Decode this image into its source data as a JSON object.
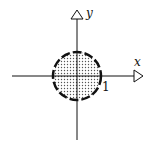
{
  "diagram": {
    "axes": {
      "x_label": "x",
      "y_label": "y"
    },
    "circle": {
      "radius_label": "1",
      "fill_pattern": "dotted",
      "boundary_style": "dashed"
    },
    "colors": {
      "stroke": "#111111",
      "fill_dots": "#555555",
      "background": "#ffffff"
    }
  }
}
